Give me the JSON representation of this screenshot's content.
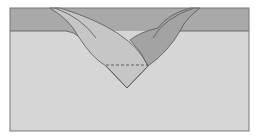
{
  "diagram": {
    "type": "geological-cross-section",
    "colors": {
      "background": "#ffffff",
      "lower_layer": "#d6d6d6",
      "upper_layer": "#a9a9a9",
      "left_wedge": "#c4c4c4",
      "right_lens": "#a3a3a3",
      "outline": "#555555",
      "dashed_line": "#444444"
    },
    "elements": [
      {
        "name": "frame",
        "desc": "rectangular cross-section border"
      },
      {
        "name": "upper-layer",
        "desc": "darker horizontal band at top"
      },
      {
        "name": "lower-layer",
        "desc": "lighter ground mass"
      },
      {
        "name": "left-wedge",
        "desc": "curved lighter wedge descending from top-left into V"
      },
      {
        "name": "right-lens",
        "desc": "darker curved lens rising to top-right"
      },
      {
        "name": "v-notch",
        "desc": "V-shaped trough with apex near center bottom"
      },
      {
        "name": "dashed-line",
        "desc": "horizontal dashed line across V"
      }
    ]
  }
}
